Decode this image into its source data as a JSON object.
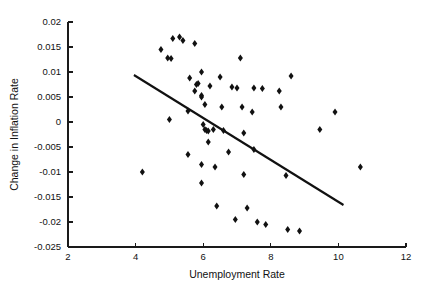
{
  "chart_data": {
    "type": "scatter",
    "title": "",
    "xlabel": "Unemployment Rate",
    "ylabel": "Change in Inflation Rate",
    "xlim": [
      2,
      12
    ],
    "ylim": [
      -0.025,
      0.02
    ],
    "xticks": [
      2,
      4,
      6,
      8,
      10,
      12
    ],
    "xtick_labels": [
      "2",
      "4",
      "6",
      "8",
      "10",
      "12"
    ],
    "yticks": [
      0.02,
      0.015,
      0.01,
      0.005,
      0,
      -0.005,
      -0.01,
      -0.015,
      -0.02,
      -0.025
    ],
    "ytick_labels": [
      "0.02",
      "0.015",
      "0.01",
      "0.005",
      "0",
      "-0.005",
      "-0.01",
      "-0.015",
      "-0.02",
      "-0.025"
    ],
    "grid": false,
    "legend": "none",
    "marker": "diamond",
    "marker_color": "#111111",
    "points": [
      {
        "x": 4.2,
        "y": -0.01
      },
      {
        "x": 4.75,
        "y": 0.0145
      },
      {
        "x": 4.95,
        "y": 0.0128
      },
      {
        "x": 5.05,
        "y": 0.0127
      },
      {
        "x": 5.1,
        "y": 0.0167
      },
      {
        "x": 5.3,
        "y": 0.017
      },
      {
        "x": 5.4,
        "y": 0.0163
      },
      {
        "x": 5.75,
        "y": 0.0157
      },
      {
        "x": 5.0,
        "y": 0.0005
      },
      {
        "x": 5.55,
        "y": 0.0022
      },
      {
        "x": 5.55,
        "y": -0.0065
      },
      {
        "x": 5.6,
        "y": 0.0088
      },
      {
        "x": 5.75,
        "y": 0.0062
      },
      {
        "x": 5.8,
        "y": 0.0075
      },
      {
        "x": 5.85,
        "y": 0.0077
      },
      {
        "x": 5.95,
        "y": 0.01
      },
      {
        "x": 5.95,
        "y": 0.005
      },
      {
        "x": 5.95,
        "y": 0.0053
      },
      {
        "x": 5.95,
        "y": -0.0085
      },
      {
        "x": 5.95,
        "y": -0.0122
      },
      {
        "x": 6.05,
        "y": 0.0035
      },
      {
        "x": 6.0,
        "y": -0.0005
      },
      {
        "x": 6.05,
        "y": -0.0015
      },
      {
        "x": 6.1,
        "y": -0.0017
      },
      {
        "x": 6.15,
        "y": -0.0018
      },
      {
        "x": 6.15,
        "y": -0.004
      },
      {
        "x": 6.2,
        "y": 0.0072
      },
      {
        "x": 6.3,
        "y": -0.0015
      },
      {
        "x": 6.35,
        "y": -0.009
      },
      {
        "x": 6.4,
        "y": -0.0168
      },
      {
        "x": 6.5,
        "y": 0.009
      },
      {
        "x": 6.55,
        "y": 0.003
      },
      {
        "x": 6.6,
        "y": -0.0017
      },
      {
        "x": 6.75,
        "y": -0.006
      },
      {
        "x": 6.85,
        "y": 0.007
      },
      {
        "x": 6.95,
        "y": -0.0195
      },
      {
        "x": 7.0,
        "y": 0.0068
      },
      {
        "x": 7.1,
        "y": 0.0128
      },
      {
        "x": 7.15,
        "y": 0.003
      },
      {
        "x": 7.2,
        "y": -0.0022
      },
      {
        "x": 7.2,
        "y": -0.0105
      },
      {
        "x": 7.3,
        "y": -0.0172
      },
      {
        "x": 7.45,
        "y": 0.002
      },
      {
        "x": 7.5,
        "y": 0.0068
      },
      {
        "x": 7.5,
        "y": -0.0055
      },
      {
        "x": 7.6,
        "y": -0.02
      },
      {
        "x": 7.75,
        "y": 0.0067
      },
      {
        "x": 7.85,
        "y": -0.0205
      },
      {
        "x": 8.25,
        "y": 0.0062
      },
      {
        "x": 8.3,
        "y": 0.003
      },
      {
        "x": 8.45,
        "y": -0.0107
      },
      {
        "x": 8.5,
        "y": -0.0215
      },
      {
        "x": 8.6,
        "y": 0.0092
      },
      {
        "x": 8.85,
        "y": -0.0218
      },
      {
        "x": 9.45,
        "y": -0.0015
      },
      {
        "x": 9.9,
        "y": 0.002
      },
      {
        "x": 10.65,
        "y": -0.009
      }
    ],
    "fit_line": {
      "label": "regression-line",
      "x1": 3.95,
      "y1": 0.0094,
      "x2": 10.15,
      "y2": -0.0166
    }
  }
}
